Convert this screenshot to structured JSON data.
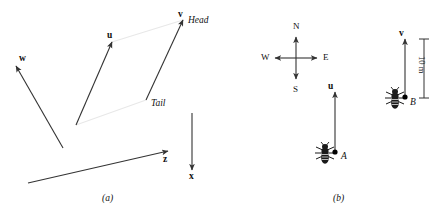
{
  "figure": {
    "width": 440,
    "height": 219,
    "background": "#ffffff",
    "stroke_color": "#333333",
    "guide_color": "#e8e8e8",
    "ink_color": "#111111"
  },
  "panel_a": {
    "caption": "(a)",
    "caption_pos": {
      "x": 102,
      "y": 194
    },
    "vectors": [
      {
        "name": "w",
        "label": "w",
        "label_pos": {
          "x": 19,
          "y": 54
        },
        "tail": {
          "x": 63,
          "y": 148
        },
        "head": {
          "x": 16,
          "y": 66
        }
      },
      {
        "name": "u",
        "label": "u",
        "label_pos": {
          "x": 107,
          "y": 31
        },
        "tail": {
          "x": 76,
          "y": 125
        },
        "head": {
          "x": 112,
          "y": 42
        }
      },
      {
        "name": "v",
        "label": "v",
        "label_pos": {
          "x": 178,
          "y": 10
        },
        "tail": {
          "x": 146,
          "y": 100
        },
        "head": {
          "x": 183,
          "y": 20
        }
      },
      {
        "name": "z",
        "label": "z",
        "label_pos": {
          "x": 163,
          "y": 155
        },
        "tail": {
          "x": 28,
          "y": 183
        },
        "head": {
          "x": 168,
          "y": 151
        }
      },
      {
        "name": "x",
        "label": "x",
        "label_pos": {
          "x": 189,
          "y": 172
        },
        "tail": {
          "x": 192,
          "y": 113
        },
        "head": {
          "x": 192,
          "y": 170
        }
      }
    ],
    "annotations": [
      {
        "name": "head",
        "text": "Head",
        "pos": {
          "x": 188,
          "y": 16
        }
      },
      {
        "name": "tail",
        "text": "Tail",
        "pos": {
          "x": 151,
          "y": 99
        }
      }
    ],
    "guides": [
      {
        "name": "guide-heads",
        "x1": 112,
        "y1": 42,
        "x2": 183,
        "y2": 20
      },
      {
        "name": "guide-tails",
        "x1": 76,
        "y1": 125,
        "x2": 146,
        "y2": 100
      }
    ]
  },
  "panel_b": {
    "caption": "(b)",
    "caption_pos": {
      "x": 333,
      "y": 194
    },
    "compass": {
      "center": {
        "x": 296,
        "y": 58
      },
      "arm": 21,
      "points": [
        {
          "name": "north",
          "label": "N",
          "pos": {
            "x": 293,
            "y": 22
          }
        },
        {
          "name": "east",
          "label": "E",
          "pos": {
            "x": 323,
            "y": 53
          }
        },
        {
          "name": "south",
          "label": "S",
          "pos": {
            "x": 293,
            "y": 85
          }
        },
        {
          "name": "west",
          "label": "W",
          "pos": {
            "x": 261,
            "y": 53
          }
        }
      ]
    },
    "insects": [
      {
        "name": "insect-a",
        "label": "A",
        "label_pos": {
          "x": 341,
          "y": 152
        },
        "body": {
          "x": 325,
          "y": 153
        },
        "dot": {
          "x": 335,
          "y": 152
        },
        "vector": {
          "name": "u",
          "label": "u",
          "label_pos": {
            "x": 328,
            "y": 82
          },
          "tail": {
            "x": 335,
            "y": 152
          },
          "head": {
            "x": 335,
            "y": 92
          }
        }
      },
      {
        "name": "insect-b",
        "label": "B",
        "label_pos": {
          "x": 410,
          "y": 98
        },
        "body": {
          "x": 395,
          "y": 98
        },
        "dot": {
          "x": 405,
          "y": 97
        },
        "vector": {
          "name": "v",
          "label": "v",
          "label_pos": {
            "x": 399,
            "y": 29
          },
          "tail": {
            "x": 405,
            "y": 97
          },
          "head": {
            "x": 405,
            "y": 39
          }
        }
      }
    ],
    "dimension": {
      "name": "scale-10m",
      "label": "10 m",
      "label_pos": {
        "x": 426,
        "y": 56
      },
      "x": 424,
      "y_top": 39,
      "y_bottom": 98,
      "tick_half": 5
    }
  }
}
